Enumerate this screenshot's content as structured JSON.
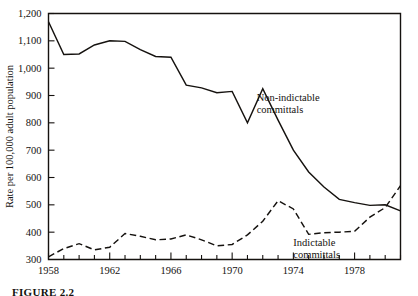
{
  "figure": {
    "caption": "FIGURE 2.2"
  },
  "chart_data": {
    "type": "line",
    "title": "",
    "xlabel": "",
    "ylabel": "Rate per 100,000 adult population",
    "xlim": [
      1958,
      1981
    ],
    "ylim": [
      300,
      1200
    ],
    "grid": false,
    "legend_position": "inline-annotations",
    "y_ticks": [
      300,
      400,
      500,
      600,
      700,
      800,
      900,
      1000,
      1100,
      1200
    ],
    "y_tick_labels": [
      "300",
      "400",
      "500",
      "600",
      "700",
      "800",
      "900",
      "1,000",
      "1,100",
      "1,200"
    ],
    "x_ticks": [
      1958,
      1962,
      1966,
      1970,
      1974,
      1978
    ],
    "x_tick_labels": [
      "1958",
      "1962",
      "1966",
      "1970",
      "1974",
      "1978"
    ],
    "x_minor_ticks": [
      1959,
      1960,
      1961,
      1963,
      1964,
      1965,
      1967,
      1968,
      1969,
      1971,
      1972,
      1973,
      1975,
      1976,
      1977,
      1979,
      1980,
      1981
    ],
    "x": [
      1958,
      1959,
      1960,
      1961,
      1962,
      1963,
      1964,
      1965,
      1966,
      1967,
      1968,
      1969,
      1970,
      1971,
      1972,
      1973,
      1974,
      1975,
      1976,
      1977,
      1978,
      1979,
      1980,
      1981
    ],
    "series": [
      {
        "name": "Non-indictable committals",
        "style": "solid",
        "label_x": 1971.6,
        "label_y": 880,
        "values": [
          1170,
          1050,
          1052,
          1085,
          1100,
          1098,
          1068,
          1043,
          1040,
          938,
          928,
          910,
          915,
          800,
          925,
          810,
          700,
          620,
          565,
          520,
          508,
          498,
          500,
          478
        ]
      },
      {
        "name": "Indictable committals",
        "style": "dashed",
        "label_x": 1974.0,
        "label_y": 348,
        "values": [
          310,
          340,
          358,
          335,
          345,
          395,
          385,
          372,
          375,
          390,
          372,
          350,
          355,
          390,
          440,
          515,
          485,
          392,
          398,
          400,
          403,
          455,
          490,
          570
        ]
      }
    ]
  }
}
